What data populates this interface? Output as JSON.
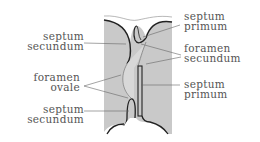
{
  "diagram": {
    "colors": {
      "tissue": "#c9c9c9",
      "outline": "#222222",
      "leader": "#666666",
      "text": "#555555",
      "background": "#ffffff"
    },
    "labels": {
      "septum_secundum_top": {
        "line1": "septum",
        "line2": "secundum"
      },
      "septum_primum_top": {
        "line1": "septum",
        "line2": "primum"
      },
      "foramen_secundum": {
        "line1": "foramen",
        "line2": "secundum"
      },
      "foramen_ovale": {
        "line1": "foramen",
        "line2": "ovale"
      },
      "septum_primum_bottom": {
        "line1": "septum",
        "line2": "primum"
      },
      "septum_secundum_bottom": {
        "line1": "septum",
        "line2": "secundum"
      }
    }
  }
}
